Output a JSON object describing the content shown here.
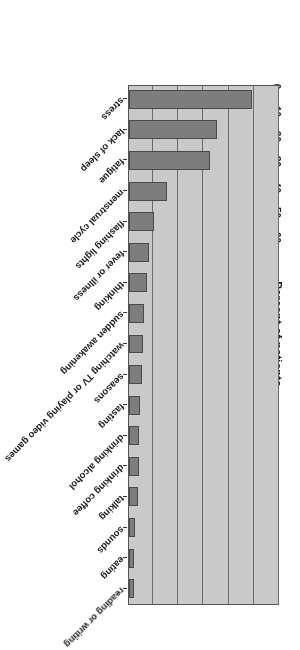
{
  "chart_data": {
    "type": "bar",
    "orientation": "horizontal",
    "title": "",
    "subtitle": "",
    "xlabel": "Percent of patients",
    "ylabel": "",
    "xlim": [
      0,
      60
    ],
    "ylim": null,
    "grid": true,
    "legend": null,
    "tick_labels": [
      "0",
      "10",
      "20",
      "30",
      "40",
      "50",
      "60"
    ],
    "ticks": [
      0,
      10,
      20,
      30,
      40,
      50,
      60
    ],
    "categories": [
      "stress",
      "lack of sleep",
      "fatigue",
      "menstrual cycle",
      "flashing lights",
      "fever or illness",
      "thinking",
      "sudden awakening",
      "watching TV or playing video games",
      "seasons",
      "fasting",
      "drinking alcohol",
      "drinking coffee",
      "talking",
      "sounds",
      "eating",
      "reading or writing"
    ],
    "values": [
      49,
      35,
      32,
      15,
      10,
      8,
      7,
      6,
      5.5,
      5,
      4.5,
      4,
      4,
      3.5,
      2.5,
      2,
      2
    ],
    "series": [
      {
        "name": "Percent of patients",
        "values": [
          49,
          35,
          32,
          15,
          10,
          8,
          7,
          6,
          5.5,
          5,
          4.5,
          4,
          4,
          3.5,
          2.5,
          2,
          2
        ]
      }
    ],
    "colors": {
      "bar_fill": "#7d7d7d",
      "bar_edge": "#4a4a4a",
      "plot_background": "#c9c9c9",
      "gridline": "#6a6a6a",
      "axis_text": "#1a1a1a",
      "figure_background": "#ffffff"
    },
    "rotation_note": "figure rendered upside down (180 degrees) in source image"
  },
  "axis": {
    "value_axis_title": "Percent of patients"
  }
}
